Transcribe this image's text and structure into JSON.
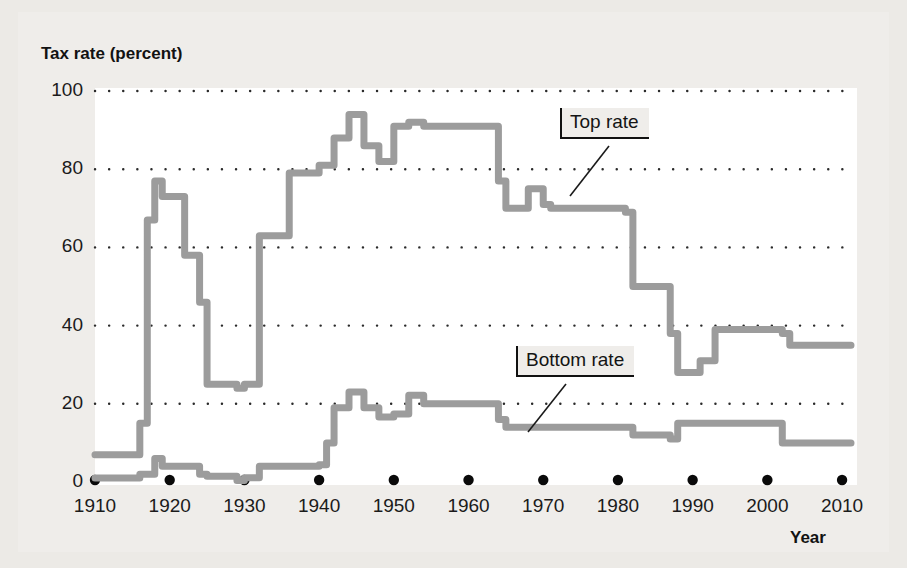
{
  "figure": {
    "y_axis_title": "Tax rate (percent)",
    "x_axis_title": "Year"
  },
  "annotations": {
    "top_rate_label": "Top rate",
    "bottom_rate_label": "Bottom rate"
  },
  "colors": {
    "line": "#9c9c9c",
    "gridline": "#2a2a2a",
    "tick_dot": "#0a0a0a",
    "panel_bg": "#efedea",
    "plot_bg": "#ffffff",
    "text": "#141414"
  },
  "chart_data": {
    "type": "line",
    "title": "",
    "xlabel": "Year",
    "ylabel": "Tax rate (percent)",
    "xlim": [
      1910,
      2012
    ],
    "ylim": [
      0,
      100
    ],
    "yticks": [
      0,
      20,
      40,
      60,
      80,
      100
    ],
    "xticks": [
      1910,
      1920,
      1930,
      1940,
      1950,
      1960,
      1970,
      1980,
      1990,
      2000,
      2010
    ],
    "ytick_labels": [
      "0",
      "20",
      "40",
      "60",
      "80",
      "100"
    ],
    "xtick_labels": [
      "1910",
      "1920",
      "1930",
      "1940",
      "1950",
      "1960",
      "1970",
      "1980",
      "1990",
      "2000",
      "2010"
    ],
    "grid": "horizontal-dotted",
    "legend": "inline-annotations",
    "series": [
      {
        "name": "Top rate",
        "step": true,
        "x": [
          1910,
          1913,
          1916,
          1917,
          1918,
          1919,
          1922,
          1924,
          1925,
          1929,
          1930,
          1932,
          1936,
          1938,
          1940,
          1941,
          1942,
          1944,
          1946,
          1948,
          1950,
          1951,
          1952,
          1954,
          1964,
          1965,
          1968,
          1970,
          1971,
          1981,
          1982,
          1987,
          1988,
          1991,
          1993,
          2001,
          2002,
          2003,
          2010
        ],
        "y": [
          7,
          7,
          15,
          67,
          77,
          73,
          58,
          46,
          25,
          24,
          25,
          63,
          79,
          79,
          81,
          81,
          88,
          94,
          86,
          82,
          91,
          91,
          92,
          91,
          77,
          70,
          75,
          71,
          70,
          69,
          50,
          38,
          28,
          31,
          39,
          39,
          38,
          35,
          35
        ]
      },
      {
        "name": "Bottom rate",
        "step": true,
        "x": [
          1910,
          1913,
          1916,
          1917,
          1918,
          1919,
          1922,
          1924,
          1925,
          1929,
          1930,
          1932,
          1934,
          1936,
          1940,
          1941,
          1942,
          1944,
          1946,
          1948,
          1950,
          1952,
          1954,
          1964,
          1965,
          1971,
          1979,
          1982,
          1987,
          1988,
          1991,
          2001,
          2002,
          2003,
          2010
        ],
        "y": [
          1,
          1,
          2,
          2,
          6,
          4,
          4,
          2,
          1.5,
          0.4,
          1.1,
          4,
          4,
          4,
          4.4,
          10,
          19,
          23,
          19,
          16.6,
          17.4,
          22.2,
          20,
          16,
          14,
          14,
          14,
          12,
          11,
          15,
          15,
          15,
          10,
          10,
          10
        ]
      }
    ]
  }
}
